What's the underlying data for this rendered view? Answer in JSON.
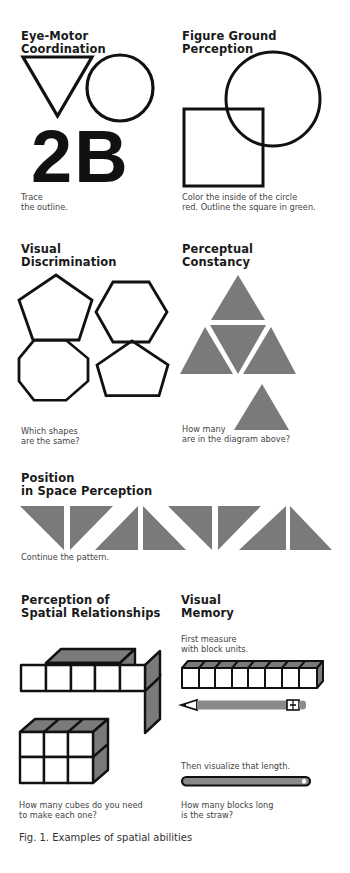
{
  "colors": {
    "ink": "#111111",
    "shape_fill": "#7a7a7a",
    "pencil_fill": "#8a8a8a",
    "caption": "#444444"
  },
  "panels": {
    "eye_motor": {
      "title_line1": "Eye-Motor",
      "title_line2": "Coordination",
      "glyph": "2B",
      "caption_line1": "Trace",
      "caption_line2": "the outline.",
      "shapes": [
        "triangle-down-outline",
        "circle-outline"
      ]
    },
    "figure_ground": {
      "title_line1": "Figure Ground",
      "title_line2": "Perception",
      "caption_line1": "Color the inside of the circle",
      "caption_line2": "red. Outline the square in green.",
      "shapes": [
        "circle-outline",
        "square-outline"
      ]
    },
    "visual_discrimination": {
      "title_line1": "Visual",
      "title_line2": "Discrimination",
      "caption_line1": "Which shapes",
      "caption_line2": "are the same?",
      "shapes": [
        "pentagon",
        "hexagon",
        "octagon",
        "pentagon"
      ]
    },
    "perceptual_constancy": {
      "title_line1": "Perceptual",
      "title_line2": "Constancy",
      "caption_line1": "How many",
      "caption_line2": "are in the diagram above?",
      "shapes": [
        "large-triangle-of-4-triangles",
        "single-triangle"
      ]
    },
    "position_in_space": {
      "title_line1": "Position",
      "title_line2": "in Space Perception",
      "caption": "Continue the pattern.",
      "pattern_count": 8
    },
    "spatial_relationships": {
      "title_line1": "Perception of",
      "title_line2": "Spatial Relationships",
      "caption_line1": "How many cubes do you need",
      "caption_line2": "to make each one?",
      "shapes": [
        "stepped-cube-stack",
        "3x2x2-cube-block"
      ]
    },
    "visual_memory": {
      "title_line1": "Visual",
      "title_line2": "Memory",
      "step1_line1": "First measure",
      "step1_line2": "with block units.",
      "block_units": 8,
      "step2": "Then visualize that length.",
      "caption_line1": "How many blocks long",
      "caption_line2": "is the straw?",
      "shapes": [
        "block-row",
        "pencil",
        "straw"
      ]
    }
  },
  "figure_caption": "Fig. 1. Examples of spatial abilities"
}
